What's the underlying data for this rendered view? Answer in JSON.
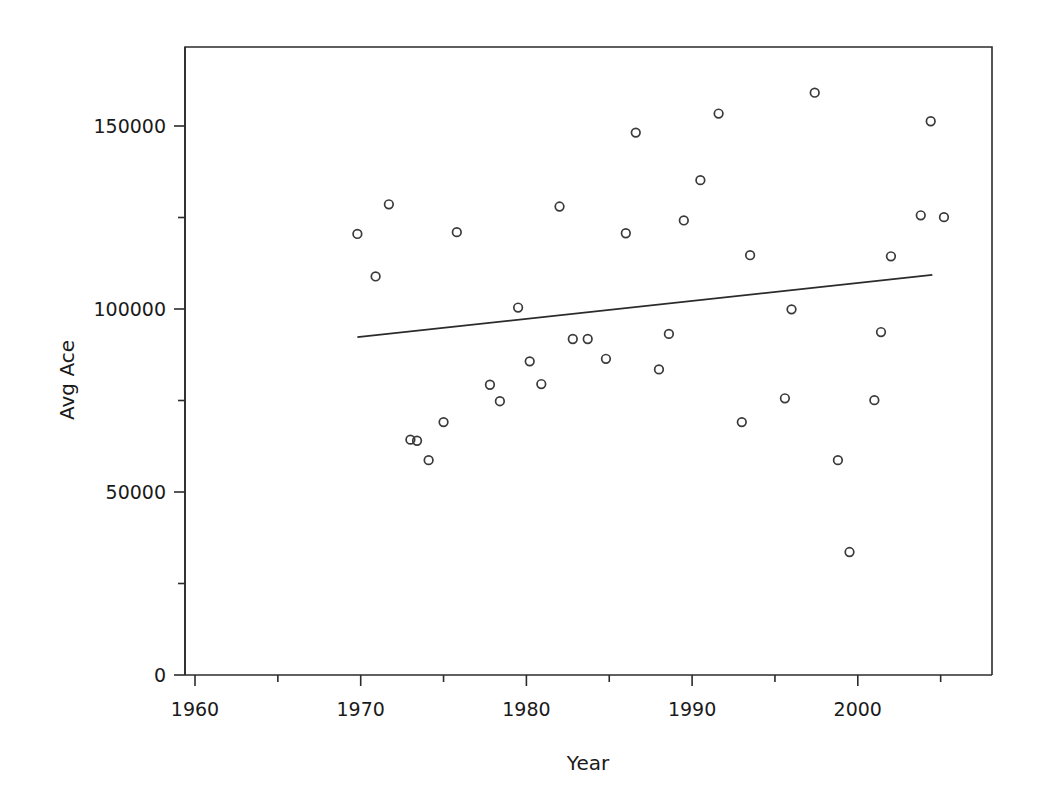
{
  "chart_data": {
    "type": "scatter",
    "title": "",
    "xlabel": "Year",
    "ylabel": "Avg Ace",
    "xlim": [
      1960,
      2008.1
    ],
    "ylim": [
      0,
      168000
    ],
    "grid": false,
    "legend": null,
    "x_ticks": [
      1960,
      1970,
      1980,
      1990,
      2000
    ],
    "x_tick_labels": [
      "1960",
      "1970",
      "1980",
      "1990",
      "2000"
    ],
    "x_minor_ticks": [
      1965,
      1975,
      1985,
      1995,
      2005
    ],
    "y_ticks": [
      0,
      50000,
      100000,
      150000
    ],
    "y_tick_labels": [
      "0",
      "50000",
      "100000",
      "150000"
    ],
    "y_minor_ticks": [
      25000,
      75000,
      125000
    ],
    "marker": "open-circle",
    "points": [
      {
        "x": 1969.8,
        "y": 120500
      },
      {
        "x": 1971.7,
        "y": 128600
      },
      {
        "x": 1970.9,
        "y": 108900
      },
      {
        "x": 1973.0,
        "y": 64300
      },
      {
        "x": 1973.4,
        "y": 64000
      },
      {
        "x": 1974.1,
        "y": 58700
      },
      {
        "x": 1975.0,
        "y": 69100
      },
      {
        "x": 1975.8,
        "y": 121000
      },
      {
        "x": 1977.8,
        "y": 79300
      },
      {
        "x": 1978.4,
        "y": 74800
      },
      {
        "x": 1979.5,
        "y": 100400
      },
      {
        "x": 1980.2,
        "y": 85700
      },
      {
        "x": 1980.9,
        "y": 79500
      },
      {
        "x": 1982.0,
        "y": 128000
      },
      {
        "x": 1982.8,
        "y": 91800
      },
      {
        "x": 1983.7,
        "y": 91800
      },
      {
        "x": 1984.8,
        "y": 86400
      },
      {
        "x": 1986.0,
        "y": 120700
      },
      {
        "x": 1986.6,
        "y": 148200
      },
      {
        "x": 1988.0,
        "y": 83500
      },
      {
        "x": 1988.6,
        "y": 93200
      },
      {
        "x": 1989.5,
        "y": 124200
      },
      {
        "x": 1990.5,
        "y": 135200
      },
      {
        "x": 1991.6,
        "y": 153400
      },
      {
        "x": 1993.0,
        "y": 69100
      },
      {
        "x": 1993.5,
        "y": 114700
      },
      {
        "x": 1995.6,
        "y": 75600
      },
      {
        "x": 1996.0,
        "y": 99900
      },
      {
        "x": 1997.4,
        "y": 159100
      },
      {
        "x": 1998.8,
        "y": 58700
      },
      {
        "x": 1999.5,
        "y": 33600
      },
      {
        "x": 2001.0,
        "y": 75100
      },
      {
        "x": 2001.4,
        "y": 93700
      },
      {
        "x": 2002.0,
        "y": 114400
      },
      {
        "x": 2003.8,
        "y": 125600
      },
      {
        "x": 2004.4,
        "y": 151300
      },
      {
        "x": 2005.2,
        "y": 125100
      }
    ],
    "trend_line": {
      "type": "linear-fit",
      "x_start": 1969.8,
      "y_start": 92300,
      "x_end": 2004.5,
      "y_end": 109300
    }
  }
}
